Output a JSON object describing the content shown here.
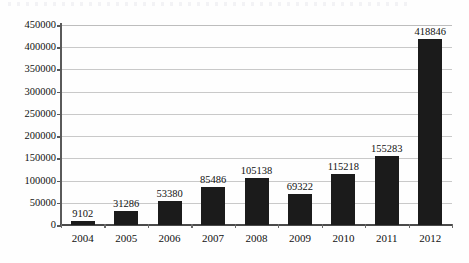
{
  "chart_data": {
    "type": "bar",
    "title": "",
    "xlabel": "",
    "ylabel": "",
    "categories": [
      "2004",
      "2005",
      "2006",
      "2007",
      "2008",
      "2009",
      "2010",
      "2011",
      "2012"
    ],
    "values": [
      9102,
      31286,
      53380,
      85486,
      105138,
      69322,
      115218,
      155283,
      418846
    ],
    "value_labels": [
      "9102",
      "31286",
      "53380",
      "85486",
      "105138",
      "69322",
      "115218",
      "155283",
      "418846"
    ],
    "ylim": [
      0,
      450000
    ],
    "ytick_step": 50000,
    "ytick_labels": [
      "0",
      "50000",
      "100000",
      "150000",
      "200000",
      "250000",
      "300000",
      "350000",
      "400000",
      "450000"
    ],
    "grid": true,
    "legend": null,
    "bar_color": "#1b1b1b",
    "gridline_color": "#c9c9c9",
    "axis_color": "#4a4a4a"
  }
}
